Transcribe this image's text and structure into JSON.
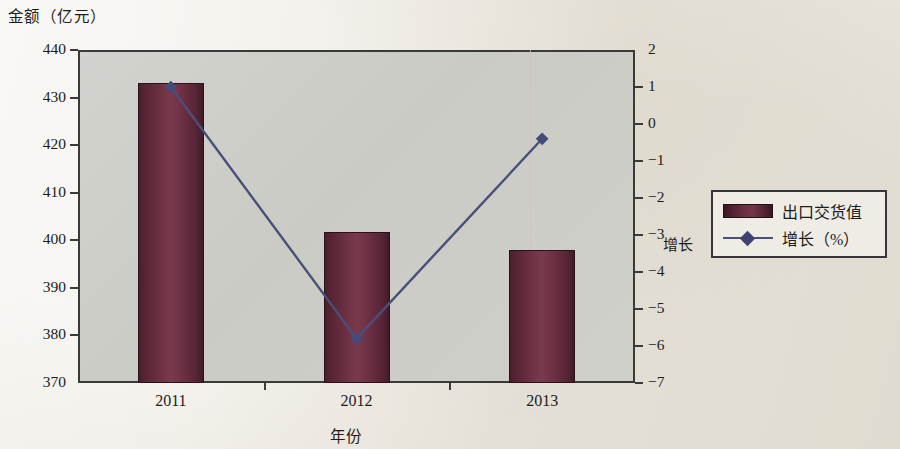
{
  "chart_data": {
    "type": "bar",
    "title": "",
    "categories": [
      "2011",
      "2012",
      "2013"
    ],
    "xlabel": "年份",
    "ylabel": "金额（亿元）",
    "y2label": "增长",
    "ylim": [
      370,
      440
    ],
    "y2lim": [
      -7,
      2
    ],
    "yticks": [
      "440",
      "430",
      "420",
      "410",
      "400",
      "390",
      "380",
      "370"
    ],
    "ytick_values": [
      440,
      430,
      420,
      410,
      400,
      390,
      380,
      370
    ],
    "y2ticks": [
      "2",
      "1",
      "0",
      "−1",
      "−2",
      "−3",
      "−4",
      "−5",
      "−6",
      "−7"
    ],
    "y2tick_values": [
      2,
      1,
      0,
      -1,
      -2,
      -3,
      -4,
      -5,
      -6,
      -7
    ],
    "grid": false,
    "legend_position": "right-outside",
    "series": [
      {
        "name": "出口交货值",
        "kind": "bar",
        "axis": "left",
        "color": "#6b2f42",
        "values": [
          433.0,
          401.7,
          398.0
        ]
      },
      {
        "name": "增长（%）",
        "kind": "line",
        "axis": "right",
        "color": "#4a4f7a",
        "marker": "diamond",
        "values": [
          1.0,
          -5.8,
          -0.4
        ]
      }
    ]
  },
  "legend": {
    "items": [
      {
        "label": "出口交货值",
        "swatch": "bar-swatch"
      },
      {
        "label": "增长（%）",
        "swatch": "line-diamond-swatch"
      }
    ]
  }
}
